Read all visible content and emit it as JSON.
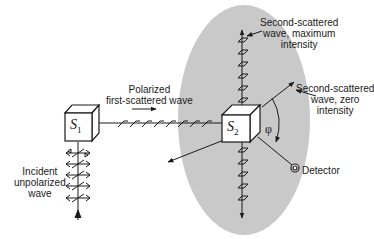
{
  "diagram": {
    "type": "double-scattering-polarization",
    "labels": {
      "incident": [
        "Incident",
        "unpolarized",
        "wave"
      ],
      "polarized": [
        "Polarized",
        "first-scattered wave"
      ],
      "max": [
        "Second-scattered",
        "wave, maximum",
        "intensity"
      ],
      "zero": [
        "Second-scattered",
        "wave, zero",
        "intensity"
      ],
      "detector": "Detector",
      "angle": "φ"
    },
    "scatterers": [
      {
        "name": "S",
        "sub": "1"
      },
      {
        "name": "S",
        "sub": "2"
      }
    ],
    "colors": {
      "ellipse": "#c9c9c9",
      "ink": "#1a1a1a",
      "background": "#ffffff"
    }
  }
}
